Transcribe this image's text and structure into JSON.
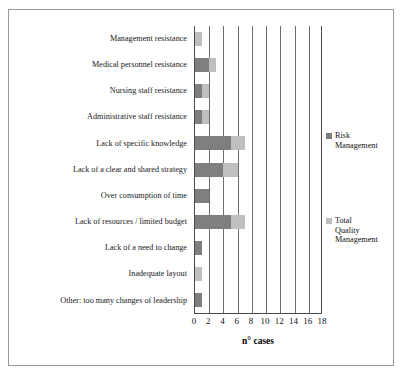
{
  "chart_data": {
    "type": "bar",
    "orientation": "horizontal",
    "stacked": true,
    "title": "",
    "xlabel": "n° cases",
    "ylabel": "",
    "xlim": [
      0,
      18
    ],
    "xticks": [
      0,
      2,
      4,
      6,
      8,
      10,
      12,
      14,
      16,
      18
    ],
    "grid": "vertical",
    "legend_position": "right",
    "categories": [
      "Management resistance",
      "Medical personnel resistance",
      "Nursing staff resistance",
      "Administrative staff resistance",
      "Lack of specific knowledge",
      "Lack of a clear and shared strategy",
      "Over consumption of time",
      "Lack of resources / limited budget",
      "Lack of a need to change",
      "Inadequate layout",
      "Other: too many changes of leadership"
    ],
    "series": [
      {
        "name": "Risk Management",
        "color": "#7f7f7f",
        "values": [
          0,
          2,
          1,
          1,
          5,
          4,
          2,
          5,
          1,
          0,
          1
        ]
      },
      {
        "name": "Total Quality Management",
        "color": "#bfbfbf",
        "values": [
          1,
          1,
          1,
          1,
          2,
          2,
          0,
          2,
          0,
          1,
          0
        ]
      }
    ]
  },
  "legend": {
    "items": [
      {
        "label": "Risk\nManagement",
        "color": "#7f7f7f"
      },
      {
        "label": "Total\nQuality\nManagement",
        "color": "#bfbfbf"
      }
    ]
  },
  "axis": {
    "x_title": "n° cases"
  }
}
